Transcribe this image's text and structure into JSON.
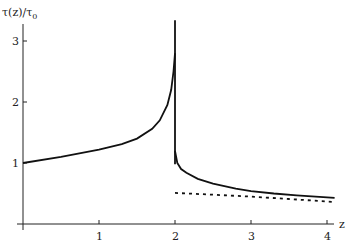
{
  "chart_data": {
    "type": "line",
    "title": "",
    "xlabel": "z",
    "ylabel": "τ(z)/τ₀",
    "xlim": [
      0,
      4.15
    ],
    "ylim": [
      0,
      3.35
    ],
    "grid": false,
    "legend": null,
    "x_ticks": [
      1,
      2,
      3,
      4
    ],
    "x_tick_labels": [
      "1",
      "2",
      "3",
      "4"
    ],
    "y_ticks": [
      1,
      2,
      3
    ],
    "y_tick_labels": [
      "1",
      "2",
      "3"
    ],
    "series": [
      {
        "name": "solid-left-branch",
        "style": "solid",
        "x": [
          0,
          0.5,
          1.0,
          1.3,
          1.5,
          1.7,
          1.8,
          1.9,
          1.95,
          1.98,
          2.0
        ],
        "y": [
          1.0,
          1.1,
          1.22,
          1.31,
          1.4,
          1.56,
          1.7,
          1.95,
          2.2,
          2.5,
          2.8
        ]
      },
      {
        "name": "solid-spike",
        "style": "solid",
        "x": [
          2.0,
          2.0
        ],
        "y": [
          0.98,
          3.34
        ]
      },
      {
        "name": "solid-right-branch",
        "style": "solid",
        "x": [
          2.0,
          2.03,
          2.08,
          2.15,
          2.3,
          2.5,
          2.8,
          3.0,
          3.3,
          3.6,
          4.1
        ],
        "y": [
          1.2,
          1.0,
          0.9,
          0.84,
          0.74,
          0.66,
          0.58,
          0.54,
          0.5,
          0.47,
          0.43
        ]
      },
      {
        "name": "dotted-asymptote",
        "style": "dotted",
        "x": [
          2.0,
          2.5,
          3.0,
          3.5,
          4.1
        ],
        "y": [
          0.51,
          0.48,
          0.45,
          0.41,
          0.36
        ]
      }
    ]
  },
  "labels": {
    "ylabel_main": "τ(z)/τ",
    "ylabel_sub": "0",
    "xlabel": "z",
    "xticks": [
      "1",
      "2",
      "3",
      "4"
    ],
    "yticks": [
      "1",
      "2",
      "3"
    ]
  }
}
